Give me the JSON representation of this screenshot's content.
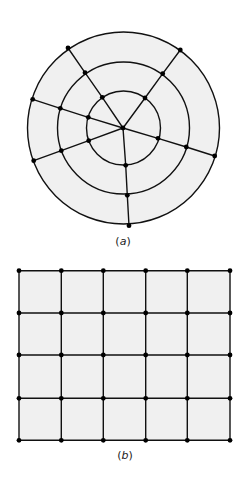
{
  "colors": {
    "fill": "#f0f0f0",
    "stroke": "#111111",
    "node": "#000000",
    "background": "#ffffff"
  },
  "figure_a": {
    "caption": "(a)",
    "caption_letter": "a",
    "description": "Circular mesh: three concentric circles divided by six rays from a central node",
    "center": [
      123.5,
      128
    ],
    "radii": [
      37,
      66,
      96
    ],
    "center_node": [
      123,
      128
    ],
    "rays": [
      {
        "name": "upper-left",
        "nodes": [
          [
            102.3,
            97.3
          ],
          [
            85,
            72.7
          ],
          [
            68,
            48
          ]
        ]
      },
      {
        "name": "upper-right",
        "nodes": [
          [
            145,
            98
          ],
          [
            162.7,
            73.7
          ],
          [
            180.3,
            50
          ]
        ]
      },
      {
        "name": "left-upper",
        "nodes": [
          [
            88.3,
            117.3
          ],
          [
            60.3,
            108.3
          ],
          [
            32.7,
            99.3
          ]
        ]
      },
      {
        "name": "left-lower",
        "nodes": [
          [
            88.7,
            140.7
          ],
          [
            61.3,
            150.7
          ],
          [
            33.7,
            160.7
          ]
        ]
      },
      {
        "name": "right",
        "nodes": [
          [
            158,
            138.3
          ],
          [
            186.3,
            147
          ],
          [
            214.7,
            156
          ]
        ]
      },
      {
        "name": "bottom",
        "nodes": [
          [
            125.7,
            165.3
          ],
          [
            127.3,
            195.3
          ],
          [
            129,
            225.7
          ]
        ]
      }
    ],
    "node_count": 19
  },
  "figure_b": {
    "caption": "(b)",
    "caption_letter": "b",
    "description": "Rectangular grid mesh: 5 columns × 4 rows of cells with nodes at every intersection",
    "columns_x": [
      19,
      61.3,
      103.3,
      145.7,
      187.3,
      230
    ],
    "rows_y": [
      270.7,
      313,
      355,
      398.3,
      440.3
    ],
    "cell_columns": 5,
    "cell_rows": 4,
    "node_count": 30
  }
}
